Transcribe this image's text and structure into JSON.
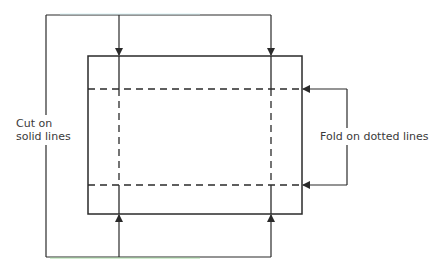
{
  "diagram": {
    "labels": {
      "cut_line1": "Cut on",
      "cut_line2": "solid lines",
      "fold": "Fold on dotted lines"
    },
    "colors": {
      "stroke": "#2a2a2a",
      "accent_top": "#cfeff2",
      "accent_bottom": "#8fd08a",
      "background": "#ffffff"
    },
    "shapes": {
      "rectangle": {
        "x": 88,
        "y": 56,
        "width": 214,
        "height": 158
      },
      "fold_lines_y": [
        89,
        185
      ],
      "cut_lines_x": [
        119,
        271
      ],
      "cut_bracket": {
        "left_x": 46,
        "top_y": 15,
        "bottom_y": 257
      },
      "fold_bracket": {
        "right_x": 347
      }
    }
  }
}
